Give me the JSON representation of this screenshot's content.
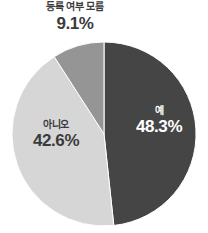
{
  "chart_data": {
    "type": "pie",
    "title": "",
    "subtitle": "",
    "xlabel": "",
    "ylabel": "",
    "legend": "none",
    "grid": false,
    "unit": "%",
    "categories": [
      "예",
      "아니오",
      "등록 여부 모름"
    ],
    "values": [
      48.3,
      42.6,
      9.1
    ],
    "value_labels": [
      "48.3%",
      "42.6%",
      "9.1%"
    ],
    "colors": [
      "#454545",
      "#d6d6d6",
      "#959595"
    ],
    "start_angle_deg": 0,
    "direction": "clockwise",
    "slices": [
      {
        "name": "예",
        "value": 48.3,
        "value_label": "48.3%",
        "color": "#454545",
        "label_position": "inside",
        "label_color": "#ffffff"
      },
      {
        "name": "아니오",
        "value": 42.6,
        "value_label": "42.6%",
        "color": "#d6d6d6",
        "label_position": "inside",
        "label_color": "#3b3b3b"
      },
      {
        "name": "등록 여부 모름",
        "value": 9.1,
        "value_label": "9.1%",
        "color": "#959595",
        "label_position": "outside-top",
        "label_color": "#3b3b3b"
      }
    ]
  },
  "canvas": {
    "background_color": "#ffffff"
  }
}
